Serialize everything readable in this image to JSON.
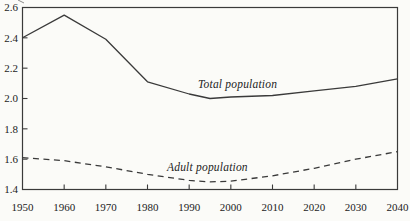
{
  "figure": {
    "background": "#fbfbf8",
    "ink_color": "#3a3a3a",
    "text_color": "#1c1c1c"
  },
  "chart_data": {
    "type": "line",
    "title": "",
    "xlabel": "",
    "ylabel": "",
    "xlim": [
      1950,
      2040
    ],
    "ylim": [
      1.4,
      2.6
    ],
    "grid": false,
    "framed": true,
    "legend_position": "inline-labels",
    "x_ticks": [
      1950,
      1960,
      1970,
      1980,
      1990,
      2000,
      2010,
      2020,
      2030,
      2040
    ],
    "x_tick_labels": [
      "1950",
      "1960",
      "1970",
      "1980",
      "1990",
      "2000",
      "2010",
      "2020",
      "2030",
      "2040"
    ],
    "y_ticks": [
      1.4,
      1.6,
      1.8,
      2.0,
      2.2,
      2.4,
      2.6
    ],
    "y_tick_labels": [
      "1.4",
      "1.6",
      "1.8",
      "2.0",
      "2.2",
      "2.4",
      "2.6"
    ],
    "series": [
      {
        "name": "Total population",
        "line_style": "solid",
        "color": "#3a3a3a",
        "points": [
          [
            1950,
            2.4
          ],
          [
            1960,
            2.55
          ],
          [
            1970,
            2.39
          ],
          [
            1980,
            2.11
          ],
          [
            1990,
            2.03
          ],
          [
            1995,
            2.0
          ],
          [
            2000,
            2.01
          ],
          [
            2010,
            2.02
          ],
          [
            2020,
            2.05
          ],
          [
            2030,
            2.08
          ],
          [
            2040,
            2.13
          ]
        ]
      },
      {
        "name": "Adult population",
        "line_style": "dashed",
        "color": "#3a3a3a",
        "points": [
          [
            1950,
            1.61
          ],
          [
            1960,
            1.59
          ],
          [
            1970,
            1.55
          ],
          [
            1980,
            1.5
          ],
          [
            1990,
            1.46
          ],
          [
            1995,
            1.45
          ],
          [
            2000,
            1.455
          ],
          [
            2010,
            1.49
          ],
          [
            2020,
            1.54
          ],
          [
            2030,
            1.6
          ],
          [
            2040,
            1.65
          ]
        ]
      }
    ]
  }
}
